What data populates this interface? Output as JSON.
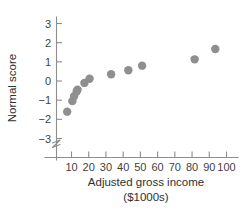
{
  "chart_data": {
    "type": "scatter",
    "title": "",
    "subtitle": "",
    "xlabel": "Adjusted gross income",
    "xlabel_units": "($1000s)",
    "ylabel": "Normal score",
    "xlim": [
      0,
      107
    ],
    "ylim": [
      -3.6,
      3.4
    ],
    "grid": false,
    "legend": null,
    "legend_position": "none",
    "y_axis_break": true,
    "y_axis_break_note": "zigzag break on y-axis below -3",
    "xticks": [
      10,
      20,
      30,
      40,
      50,
      60,
      70,
      80,
      90,
      100
    ],
    "xtick_labels": [
      "10",
      "20",
      "30",
      "40",
      "50",
      "60",
      "70",
      "80",
      "90",
      "100"
    ],
    "yticks": [
      3,
      2,
      1,
      0,
      -1,
      -2,
      -3
    ],
    "ytick_labels": [
      "3",
      "2",
      "1",
      "0",
      "−1",
      "−2",
      "−3"
    ],
    "marker": "circle",
    "marker_color": "#8f8f8f",
    "marker_size": 4.2,
    "x": [
      7.5,
      10.5,
      11.5,
      13.0,
      13.5,
      17.5,
      20.5,
      33.0,
      43.0,
      51.0,
      81.5,
      93.5
    ],
    "y": [
      -1.6,
      -1.05,
      -0.8,
      -0.55,
      -0.45,
      -0.1,
      0.12,
      0.35,
      0.56,
      0.8,
      1.13,
      1.67
    ],
    "points": [
      {
        "x": 7.5,
        "y": -1.6
      },
      {
        "x": 10.5,
        "y": -1.05
      },
      {
        "x": 11.5,
        "y": -0.8
      },
      {
        "x": 13.0,
        "y": -0.55
      },
      {
        "x": 13.5,
        "y": -0.45
      },
      {
        "x": 17.5,
        "y": -0.1
      },
      {
        "x": 20.5,
        "y": 0.12
      },
      {
        "x": 33.0,
        "y": 0.35
      },
      {
        "x": 43.0,
        "y": 0.56
      },
      {
        "x": 51.0,
        "y": 0.8
      },
      {
        "x": 81.5,
        "y": 1.13
      },
      {
        "x": 93.5,
        "y": 1.67
      }
    ]
  },
  "figure": {
    "axis_color": "#8d8d8d",
    "text_color": "#3f3f3f",
    "background": "#ffffff"
  }
}
